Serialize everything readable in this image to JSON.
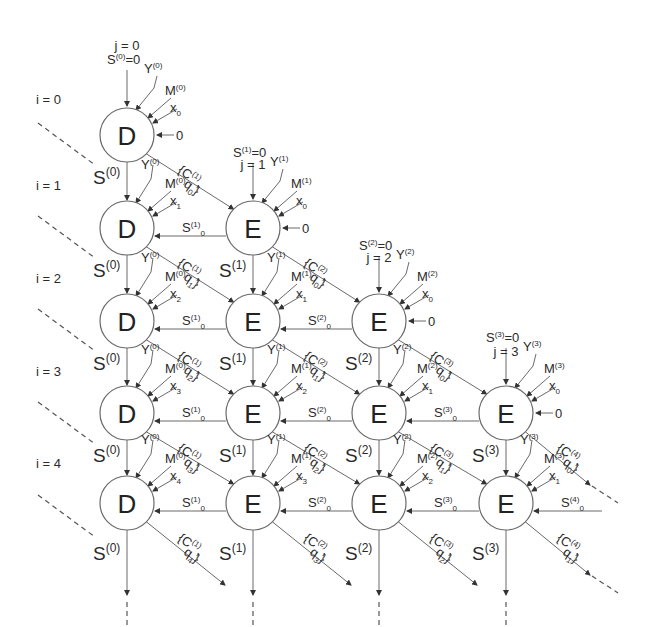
{
  "diagram": {
    "type": "systolic-array",
    "column_labels": [
      "j = 0",
      "j = 1",
      "j = 2",
      "j = 3"
    ],
    "row_labels": [
      "i = 0",
      "i = 1",
      "i = 2",
      "i = 3",
      "i = 4"
    ],
    "node_types": {
      "first_column": "D",
      "other_columns": "E"
    },
    "colors": {
      "stroke": "#6a6a6a",
      "text": "#2a2a2a",
      "background": "#ffffff"
    },
    "nodes": [
      {
        "i": 0,
        "j": 0,
        "label": "D"
      },
      {
        "i": 1,
        "j": 0,
        "label": "D"
      },
      {
        "i": 1,
        "j": 1,
        "label": "E"
      },
      {
        "i": 2,
        "j": 0,
        "label": "D"
      },
      {
        "i": 2,
        "j": 1,
        "label": "E"
      },
      {
        "i": 2,
        "j": 2,
        "label": "E"
      },
      {
        "i": 3,
        "j": 0,
        "label": "D"
      },
      {
        "i": 3,
        "j": 1,
        "label": "E"
      },
      {
        "i": 3,
        "j": 2,
        "label": "E"
      },
      {
        "i": 3,
        "j": 3,
        "label": "E"
      },
      {
        "i": 4,
        "j": 0,
        "label": "D"
      },
      {
        "i": 4,
        "j": 1,
        "label": "E"
      },
      {
        "i": 4,
        "j": 2,
        "label": "E"
      },
      {
        "i": 4,
        "j": 3,
        "label": "E"
      }
    ],
    "top_inputs": [
      {
        "j": 0,
        "s_init": "S(0)=0",
        "y": "Y(0)",
        "m": "M(0)",
        "x": "x0",
        "right": "0"
      },
      {
        "j": 1,
        "s_init": "S(1)=0",
        "y": "Y(1)",
        "m": "M(1)",
        "x": "x0",
        "right": "0"
      },
      {
        "j": 2,
        "s_init": "S(2)=0",
        "y": "Y(2)",
        "m": "M(2)",
        "x": "x0",
        "right": "0"
      },
      {
        "j": 3,
        "s_init": "S(3)=0",
        "y": "Y(3)",
        "m": "M(3)",
        "x": "x0",
        "right": "0"
      }
    ],
    "edge_labels": {
      "vertical_s": [
        "S(0)",
        "S(1)",
        "S(2)",
        "S(3)"
      ],
      "horizontal_s0": [
        "S(1)0",
        "S(2)0",
        "S(3)0",
        "S(4)0"
      ],
      "diagonal_cq": "{C(j+1), q(i-j)}"
    }
  }
}
